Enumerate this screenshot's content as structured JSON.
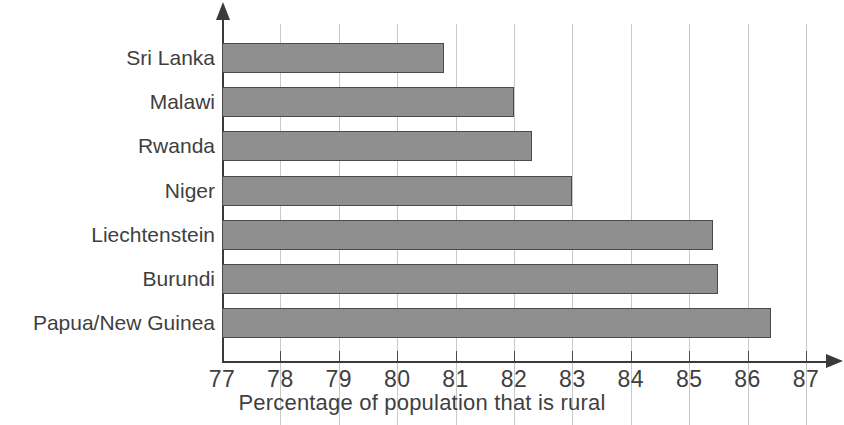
{
  "chart_data": {
    "type": "bar",
    "orientation": "horizontal",
    "title": "",
    "subtitle": "",
    "xlabel": "Percentage of population that is rural",
    "ylabel": "",
    "categories": [
      "Sri Lanka",
      "Malawi",
      "Rwanda",
      "Niger",
      "Liechtenstein",
      "Burundi",
      "Papua/New Guinea"
    ],
    "values": [
      80.8,
      82.0,
      82.3,
      83.0,
      85.4,
      85.5,
      86.4
    ],
    "xlim": [
      77,
      87
    ],
    "xticks": [
      77,
      78,
      79,
      80,
      81,
      82,
      83,
      84,
      85,
      86,
      87
    ],
    "xtick_labels": [
      "77",
      "78",
      "79",
      "80",
      "81",
      "82",
      "83",
      "84",
      "85",
      "86",
      "87"
    ],
    "grid": "vertical",
    "legend": "none",
    "bar_fill_color": "#8f8f8f",
    "bar_border_color": "#4a4a4a",
    "gridline_color": "#c9c9c9",
    "axis_color": "#3a3a3a",
    "text_color": "#3f3f3f",
    "background_color": "#ffffff"
  },
  "axis": {
    "x_title": "Percentage of population that is rural"
  }
}
